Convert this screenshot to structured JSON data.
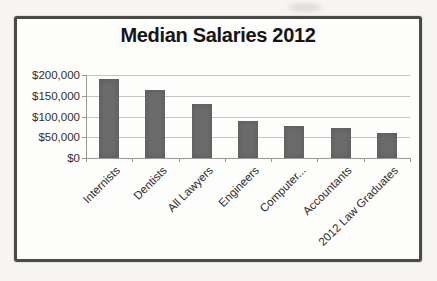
{
  "chart_data": {
    "type": "bar",
    "title": "Median Salaries 2012",
    "categories": [
      "Internists",
      "Dentists",
      "All Lawyers",
      "Engineers",
      "Computer...",
      "Accountants",
      "2012 Law Graduates"
    ],
    "values": [
      190000,
      165000,
      130000,
      90000,
      78000,
      72000,
      60000
    ],
    "xlabel": "",
    "ylabel": "",
    "ylim": [
      0,
      200000
    ],
    "y_ticks": [
      {
        "value": 0,
        "label": "$0"
      },
      {
        "value": 50000,
        "label": "$50,000"
      },
      {
        "value": 100000,
        "label": "$100,000"
      },
      {
        "value": 150000,
        "label": "$150,000"
      },
      {
        "value": 200000,
        "label": "$200,000"
      }
    ],
    "grid": true,
    "legend_position": "none",
    "bar_color": "#6b6b6b"
  },
  "colors": {
    "frame_border": "#4a4a48",
    "gridline": "#c4c4c2",
    "axis": "#999996",
    "background_outer": "#f7f5f2",
    "background_inner": "#fdfdfc",
    "title_text": "#151515",
    "tick_text": "#2f2f2d"
  }
}
